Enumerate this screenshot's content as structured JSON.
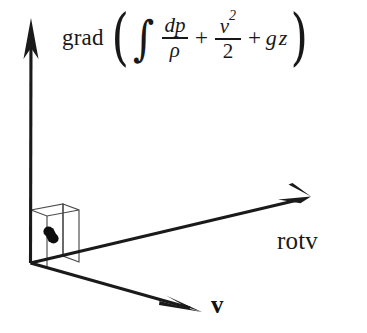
{
  "figure": {
    "background_color": "#ffffff",
    "stroke_color": "#1a1a1a",
    "thin_stroke_color": "#555555"
  },
  "formula": {
    "operator": "grad",
    "paren_open": "(",
    "paren_close": ")",
    "integral_symbol": "∫",
    "term1": {
      "numerator": "dp",
      "denominator": "ρ"
    },
    "plus1": "+",
    "term2": {
      "numerator": "v",
      "numerator_exponent": "2",
      "denominator": "2"
    },
    "plus2": "+",
    "term3": {
      "g": "g",
      "z": "z"
    },
    "plain_text": "grad ( ∫ dp/ρ + v²/2 + gz )"
  },
  "axes": {
    "vertical": {
      "name": "grad-axis",
      "origin": [
        30,
        263
      ],
      "tip": [
        31,
        20
      ]
    },
    "rotv": {
      "label": "rotv",
      "origin": [
        30,
        263
      ],
      "tip": [
        307,
        197
      ]
    },
    "v": {
      "label": "v",
      "origin": [
        30,
        263
      ],
      "tip": [
        198,
        312
      ]
    }
  },
  "plane_element": {
    "name": "surface-element",
    "marker": "double-dot",
    "marker_points": [
      [
        47,
        233
      ],
      [
        53,
        239
      ]
    ]
  }
}
